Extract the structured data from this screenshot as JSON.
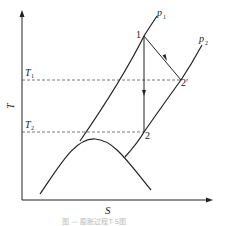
{
  "diagram": {
    "type": "T-S diagram (expansion process)",
    "axes": {
      "y_label": "T",
      "x_label": "S"
    },
    "isobars": [
      {
        "label": "p",
        "sub": "1"
      },
      {
        "label": "p",
        "sub": "2"
      }
    ],
    "temperature_levels": [
      {
        "label": "T",
        "sub": "1"
      },
      {
        "label": "T",
        "sub": "2"
      }
    ],
    "points": {
      "p1_state": "1",
      "p2_real": "2′",
      "p2_isentropic": "2"
    },
    "caption": "图 — 膨胀过程T-S图",
    "colors": {
      "line": "#222222",
      "dashed": "#555555",
      "caption": "#bbbbbb"
    }
  }
}
